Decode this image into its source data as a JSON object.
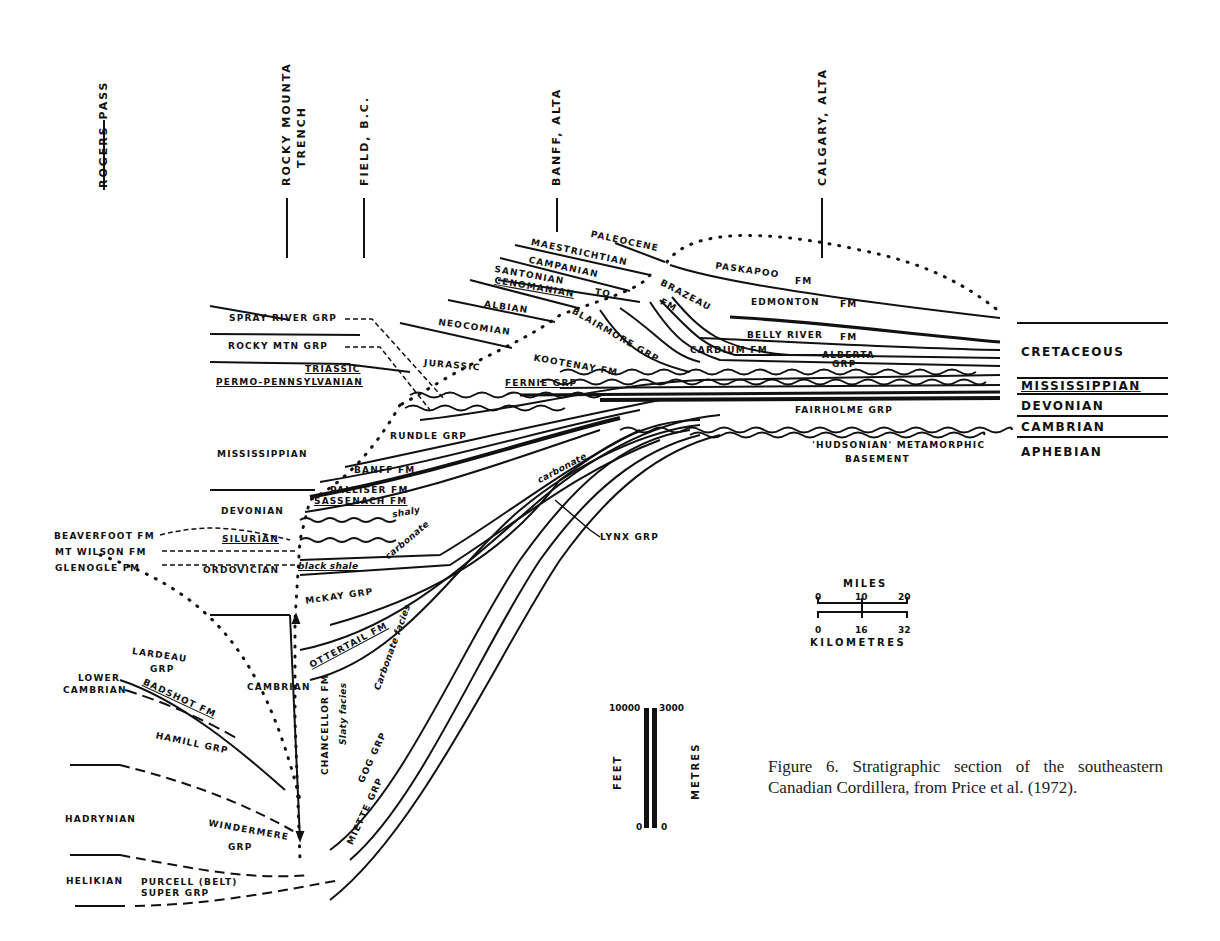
{
  "locations": [
    {
      "label": "ROGERS PASS"
    },
    {
      "label": "ROCKY MOUNTA",
      "label2": "TRENCH"
    },
    {
      "label": "FIELD, B.C."
    },
    {
      "label": "BANFF, ALTA"
    },
    {
      "label": "CALGARY, ALTA"
    }
  ],
  "periods": [
    "CRETACEOUS",
    "MISSISSIPPIAN",
    "DEVONIAN",
    "CAMBRIAN",
    "APHEBIAN"
  ],
  "upper_units": {
    "paleocene": "PALEOCENE",
    "maestrichtian": "MAESTRICHTIAN",
    "campanian": "CAMPANIAN",
    "santonian": "SANTONIAN",
    "to": "TO",
    "cenomanian": "CENOMANIAN",
    "albian": "ALBIAN",
    "neocomian": "NEOCOMIAN",
    "jurassic": "JURASSIC",
    "paskapoo": "PASKAPOO",
    "paskapoo_fm": "FM",
    "brazeau": "BRAZEAU",
    "brazeau_fm": "FM",
    "edmonton": "EDMONTON",
    "edmonton_fm": "FM",
    "belly_river": "BELLY RIVER",
    "belly_river_fm": "FM",
    "cardium": "CARDIUM FM",
    "alberta": "ALBERTA",
    "alberta_grp": "GRP",
    "blairmore": "BLAIRMORE GRP",
    "kootenay": "KOOTENAY FM",
    "fernie": "FERNIE GRP"
  },
  "left_labels": {
    "spray_river": "SPRAY RIVER GRP",
    "rocky_mtn": "ROCKY MTN GRP",
    "triassic": "TRIASSIC",
    "permo_penn": "PERMO-PENNSYLVANIAN",
    "mississippian": "MISSISSIPPIAN",
    "devonian": "DEVONIAN",
    "beaverfoot": "BEAVERFOOT FM",
    "silurian": "SILURIAN",
    "mt_wilson": "MT WILSON FM",
    "glenogle": "GLENOGLE FM",
    "ordovician": "ORDOVICIAN",
    "lardeau": "LARDEAU",
    "lardeau_grp": "GRP",
    "lower": "LOWER",
    "lower_cambrian": "CAMBRIAN",
    "badshot": "BADSHOT FM",
    "hamill": "HAMILL GRP",
    "cambrian": "CAMBRIAN",
    "hadrynian": "HADRYNIAN",
    "windermere": "WINDERMERE",
    "windermere_grp": "GRP",
    "helikian": "HELIKIAN",
    "purcell": "PURCELL (BELT)",
    "purcell_super": "SUPER GRP"
  },
  "middle_units": {
    "rundle": "RUNDLE GRP",
    "banff": "BANFF FM",
    "palliser": "PALLISER FM",
    "sassenach": "SASSENACH FM",
    "shaly": "shaly",
    "carbonate1": "carbonate",
    "carbonate2": "carbonate",
    "black_shale": "black shale",
    "lynx": "LYNX GRP",
    "mckay": "McKAY GRP",
    "ottertail": "OTTERTAIL FM",
    "carbonate_facies": "Carbonate facies",
    "slaty_facies": "Slaty facies",
    "chancellor": "CHANCELLOR FM",
    "gog": "GOG GRP",
    "miette": "MIETTE GRP",
    "fairholme": "FAIRHOLME GRP",
    "hudsonian": "'HUDSONIAN' METAMORPHIC",
    "basement": "BASEMENT"
  },
  "horizontal_scale": {
    "title": "MILES",
    "miles_ticks": [
      "0",
      "10",
      "20"
    ],
    "km_ticks": [
      "0",
      "16",
      "32"
    ],
    "km_title": "KILOMETRES"
  },
  "vertical_scale": {
    "feet_label": "FEET",
    "metres_label": "METRES",
    "feet_top": "10000",
    "feet_bottom": "0",
    "metres_top": "3000",
    "metres_bottom": "0"
  },
  "caption": "Figure 6. Stratigraphic section of the southeastern Canadian Cordillera, from Price et al. (1972)."
}
